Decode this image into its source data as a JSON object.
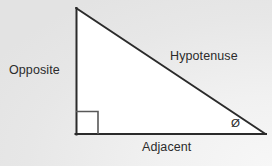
{
  "figure": {
    "background_color_top_left": "#e7e7e7",
    "background_color_bottom_right": "#f7f7f7",
    "triangle_fill": "#ffffff",
    "stroke_color": "#2b2b2b",
    "marker_stroke_color": "#555555",
    "text_color": "#2b2b2b",
    "vertices": {
      "apex": [
        76,
        8
      ],
      "bottom_left": [
        76,
        134
      ],
      "bottom_right": [
        265,
        134
      ]
    },
    "right_angle_marker": {
      "x": 76,
      "y": 111,
      "size": 22
    }
  },
  "labels": {
    "opposite": "Opposite",
    "hypotenuse": "Hypotenuse",
    "adjacent": "Adjacent",
    "angle_symbol": "Ø"
  }
}
